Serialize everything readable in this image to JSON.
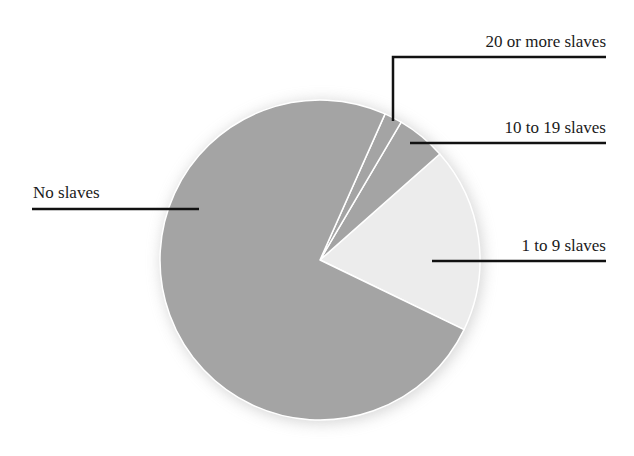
{
  "chart_data": {
    "type": "pie",
    "title": "",
    "series": [
      {
        "name": "No slaves",
        "value": 74.5,
        "color": "#a4a4a4"
      },
      {
        "name": "1 to 9 slaves",
        "value": 18.7,
        "color": "#ececec"
      },
      {
        "name": "10 to 19 slaves",
        "value": 5.0,
        "color": "#a4a4a4"
      },
      {
        "name": "20 or more slaves",
        "value": 1.8,
        "color": "#a4a4a4"
      }
    ],
    "legend": "callout labels with leader lines",
    "start_angle_deg_ccw_from_east": -25.8,
    "center": [
      320,
      260
    ],
    "radius": 160
  },
  "labels": {
    "no_slaves": "No slaves",
    "one_to_nine": "1 to 9 slaves",
    "ten_to_nineteen": "10 to 19 slaves",
    "twenty_plus": "20 or more slaves"
  }
}
